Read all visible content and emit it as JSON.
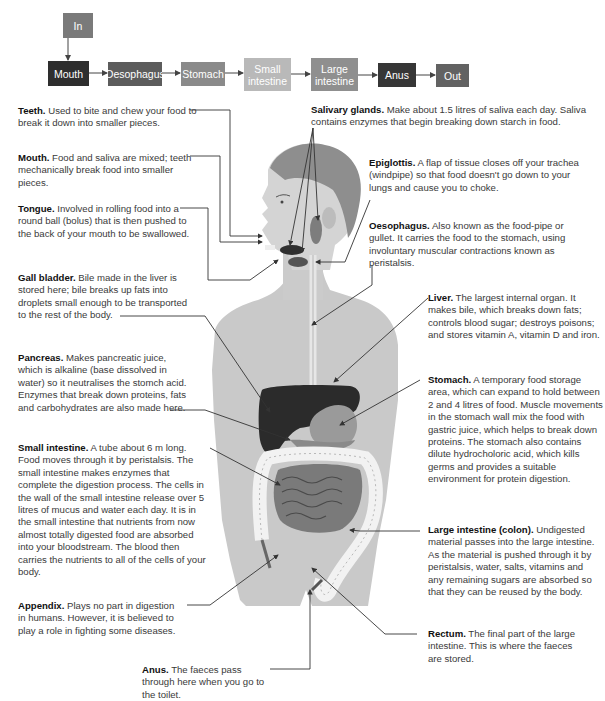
{
  "flow": {
    "input": {
      "label": "In",
      "color": "#7a7a7a"
    },
    "steps": [
      {
        "label": "Mouth",
        "color": "#2e2e2e"
      },
      {
        "label": "Oesophagus",
        "color": "#5c5c5c"
      },
      {
        "label": "Stomach",
        "color": "#8a8a8a"
      },
      {
        "label": "Small\nintestine",
        "color": "#b9b9b9"
      },
      {
        "label": "Large\nintestine",
        "color": "#8f8f8f"
      },
      {
        "label": "Anus",
        "color": "#363636"
      },
      {
        "label": "Out",
        "color": "#626262"
      }
    ]
  },
  "labels": {
    "teeth": {
      "title": "Teeth.",
      "text": "Used to bite and chew your food to break it down into smaller pieces."
    },
    "mouth": {
      "title": "Mouth.",
      "text": "Food and saliva are mixed; teeth mechanically break food into smaller pieces."
    },
    "tongue": {
      "title": "Tongue.",
      "text": "Involved in rolling food into a round ball (bolus) that is then pushed to the back of your mouth to be swallowed."
    },
    "gall_bladder": {
      "title": "Gall bladder.",
      "text": "Bile made in the liver is stored here; bile breaks up fats into droplets small enough to be transported to the rest of the body."
    },
    "pancreas": {
      "title": "Pancreas.",
      "text": "Makes pancreatic juice, which is alkaline (base dissolved in water) so it neutralises the stomch acid. Enzymes that break down proteins, fats and carbohydrates are also made here."
    },
    "small_intestine": {
      "title": "Small intestine.",
      "text": "A tube about 6 m long. Food moves through it by peristalsis. The small intestine makes enzymes that complete the digestion process. The cells in the wall of the small intestine release over 5 litres of mucus and water each day. It is in the small intestine that nutrients from now almost totally digested food are absorbed into your bloodstream. The blood then carries the nutrients to all of the cells of your body."
    },
    "appendix": {
      "title": "Appendix.",
      "text": "Plays no part in digestion in humans. However, it is believed to play a role in fighting some diseases."
    },
    "anus": {
      "title": "Anus.",
      "text": "The faeces pass through here when you go to the toilet."
    },
    "salivary_glands": {
      "title": "Salivary glands.",
      "text": "Make about 1.5 litres of saliva each day. Saliva contains enzymes that begin breaking down starch in food."
    },
    "epiglottis": {
      "title": "Epiglottis.",
      "text": "A flap of tissue closes off your trachea (windpipe) so that food doesn't go down to your lungs and cause you to choke."
    },
    "oesophagus": {
      "title": "Oesophagus.",
      "text": "Also known as the food-pipe or gullet. It carries the food to the stomach, using involuntary muscular contractions known as peristalsis."
    },
    "liver": {
      "title": "Liver.",
      "text": "The largest internal organ. It makes bile, which breaks down fats; controls blood sugar; destroys poisons; and stores vitamin A, vitamin D and iron."
    },
    "stomach": {
      "title": "Stomach.",
      "text": "A temporary food storage area, which can expand to hold between 2 and 4 litres of food. Muscle movements in the stomach wall mix the food with gastric juice, which helps to break down proteins. The stomach also contains dilute hydrocholoric acid, which kills germs and provides a suitable environment for protein digestion."
    },
    "large_intestine": {
      "title": "Large intestine (colon).",
      "text": "Undigested material passes into the large intestine. As the material is pushed through it by peristalsis, water, salts, vitamins and any remaining sugars are absorbed so that they can be reused by the body."
    },
    "rectum": {
      "title": "Rectum.",
      "text": "The final part of the large intestine. This is where the faeces are stored."
    }
  }
}
